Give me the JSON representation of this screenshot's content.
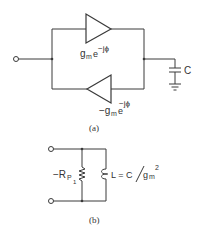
{
  "figure_a": {
    "caption": "(a)",
    "top_amp": {
      "gain": "g",
      "sub": "m",
      "exp_base": "e",
      "exp": "−jϕ"
    },
    "bottom_amp": {
      "gain": "−g",
      "sub": "m",
      "exp_base": "e",
      "exp": "−jϕ"
    },
    "capacitor_label": "C"
  },
  "figure_b": {
    "caption": "(b)",
    "resistor_label": "−R",
    "resistor_sub": "P",
    "resistor_sub2": "1",
    "inductor_label": "L = C",
    "inductor_denom": "g",
    "inductor_denom_sub": "m",
    "inductor_denom_exp": "2"
  },
  "colors": {
    "line": "#3a3a3a",
    "text": "#333333",
    "background": "#ffffff"
  }
}
